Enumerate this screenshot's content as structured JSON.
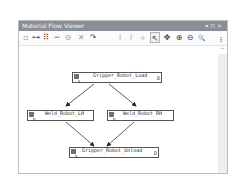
{
  "window": {
    "title": "Material Flow Viewer",
    "controls": [
      "▾",
      "⊓",
      "×"
    ]
  },
  "toolbar": {
    "buttons": [
      {
        "name": "new-node-icon",
        "glyph": "▫",
        "enabled": false
      },
      {
        "name": "add-flow-icon",
        "glyph": "⊶",
        "enabled": true
      },
      {
        "name": "layout-icon",
        "glyph": "⠿",
        "enabled": true
      },
      {
        "name": "link-icon",
        "glyph": "━",
        "enabled": false
      },
      {
        "name": "unlink-icon",
        "glyph": "⊖",
        "enabled": false
      },
      {
        "name": "delete-icon",
        "glyph": "✕",
        "enabled": false
      },
      {
        "name": "route-icon",
        "glyph": "↷",
        "enabled": true
      },
      {
        "name": "align-vertical-icon",
        "glyph": "⁞",
        "enabled": false
      },
      {
        "name": "align-horizontal-icon",
        "glyph": "⁞",
        "enabled": false
      },
      {
        "name": "arrow-left-icon",
        "glyph": "◃",
        "enabled": false
      },
      {
        "name": "select-pointer-icon",
        "glyph": "↖",
        "enabled": true,
        "selected": true
      },
      {
        "name": "pan-icon",
        "glyph": "✥",
        "enabled": true
      },
      {
        "name": "zoom-in-icon",
        "glyph": "⊕",
        "enabled": true
      },
      {
        "name": "zoom-out-icon",
        "glyph": "⊖",
        "enabled": true
      },
      {
        "name": "zoom-fit-icon",
        "glyph": "🔍",
        "enabled": true
      },
      {
        "name": "overflow-icon",
        "glyph": "⁝",
        "enabled": true
      }
    ]
  },
  "diagram": {
    "nodes": [
      {
        "id": "gripper_load",
        "label": "Gripper_Robot_Load"
      },
      {
        "id": "weld_lh",
        "label": "Weld_Robot_LH"
      },
      {
        "id": "weld_rh",
        "label": "Weld_Robot_RH"
      },
      {
        "id": "gripper_unload",
        "label": "Gripper_Robot_Unload"
      }
    ],
    "edges": [
      {
        "from": "gripper_load",
        "to": "weld_lh"
      },
      {
        "from": "gripper_load",
        "to": "weld_rh"
      },
      {
        "from": "weld_lh",
        "to": "gripper_unload"
      },
      {
        "from": "weld_rh",
        "to": "gripper_unload"
      }
    ],
    "port_marker": "D",
    "sub_marker": "S"
  },
  "scrollbar": {
    "up_glyph": "^"
  }
}
